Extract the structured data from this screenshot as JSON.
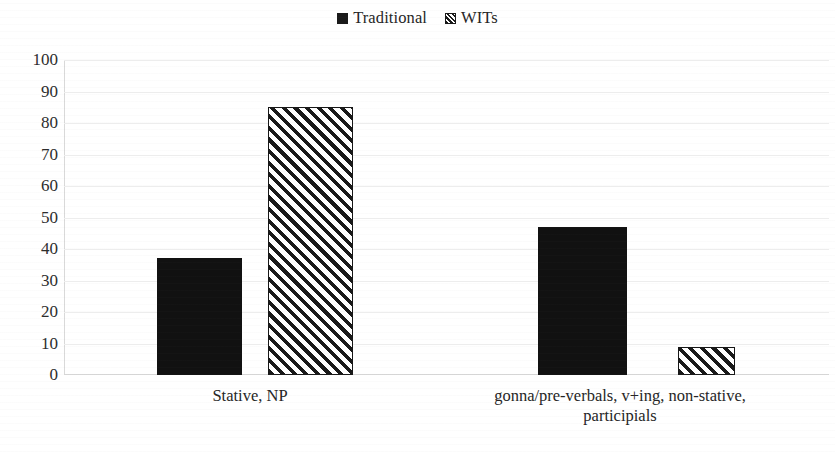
{
  "chart_data": {
    "type": "bar",
    "title": "",
    "subtitle": "",
    "xlabel": "",
    "ylabel": "",
    "ylim": [
      0,
      100
    ],
    "yticks": [
      100,
      90,
      80,
      70,
      60,
      50,
      40,
      30,
      20,
      10,
      0
    ],
    "grid": true,
    "legend_position": "top-center",
    "categories": [
      "Stative, NP",
      "gonna/pre-verbals, v+ing, non-stative, participials"
    ],
    "series": [
      {
        "name": "Traditional",
        "values": [
          37,
          47
        ],
        "fill": "solid",
        "color": "#111111"
      },
      {
        "name": "WITs",
        "values": [
          85,
          9
        ],
        "fill": "diagonal-hatch",
        "color": "#171717"
      }
    ]
  },
  "legend": {
    "entries": [
      {
        "label": "Traditional",
        "marker": "solid-square-icon"
      },
      {
        "label": "WITs",
        "marker": "hatched-square-icon"
      }
    ]
  },
  "axes": {
    "y": {
      "ticks": [
        "100",
        "90",
        "80",
        "70",
        "60",
        "50",
        "40",
        "30",
        "20",
        "10",
        "0"
      ]
    },
    "x": {
      "categories": [
        {
          "lines": [
            "Stative, NP"
          ]
        },
        {
          "lines": [
            "gonna/pre-verbals, v+ing, non-stative,",
            "participials"
          ]
        }
      ]
    }
  },
  "colors": {
    "bar_solid": "#111111",
    "bar_hatch": "#171717",
    "gridline": "#ededed",
    "axis": "#d8d8d8",
    "text": "#262626",
    "background": "#ffffff"
  }
}
